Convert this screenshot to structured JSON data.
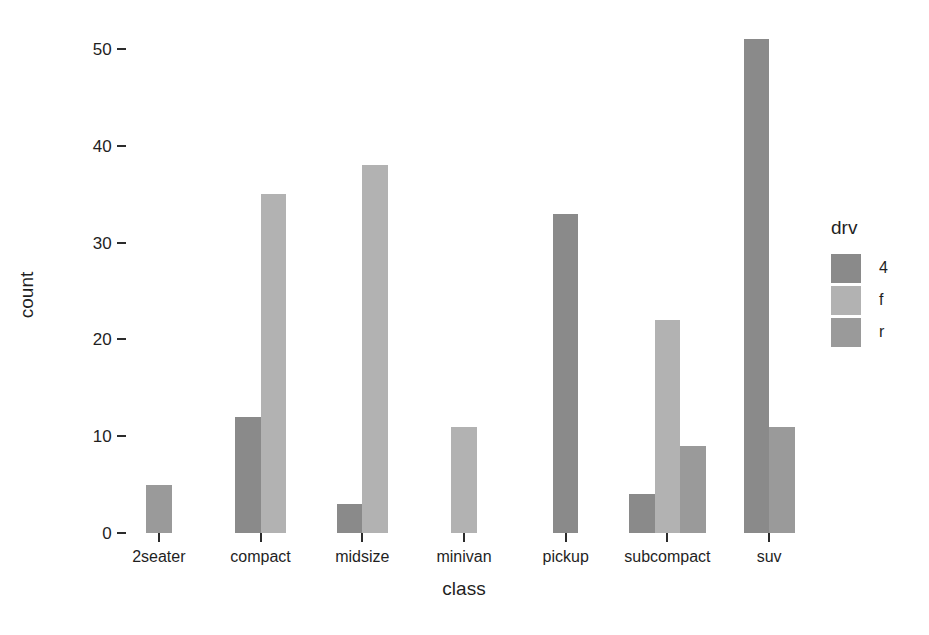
{
  "chart_data": {
    "type": "bar",
    "title": "",
    "subtitle": "",
    "xlabel": "class",
    "ylabel": "count",
    "categories": [
      "2seater",
      "compact",
      "midsize",
      "minivan",
      "pickup",
      "subcompact",
      "suv"
    ],
    "series": [
      {
        "name": "4",
        "color": "#8a8a8a",
        "values": [
          0,
          12,
          3,
          0,
          33,
          4,
          51
        ]
      },
      {
        "name": "f",
        "color": "#b2b2b2",
        "values": [
          0,
          35,
          38,
          11,
          0,
          22,
          0
        ]
      },
      {
        "name": "r",
        "color": "#9a9a9a",
        "values": [
          5,
          0,
          0,
          0,
          0,
          9,
          11
        ]
      }
    ],
    "legend": {
      "title": "drv",
      "position": "right",
      "entries": [
        {
          "label": "4",
          "color": "#8a8a8a"
        },
        {
          "label": "f",
          "color": "#b2b2b2"
        },
        {
          "label": "r",
          "color": "#9a9a9a"
        }
      ]
    },
    "y_ticks": [
      0,
      10,
      20,
      30,
      40,
      50
    ],
    "ylim": [
      0,
      53
    ],
    "xlim_categories": 7,
    "grid": false,
    "bar_mode": "dodge",
    "background": "#ffffff",
    "axis_text_color": "#1f1f1f"
  }
}
